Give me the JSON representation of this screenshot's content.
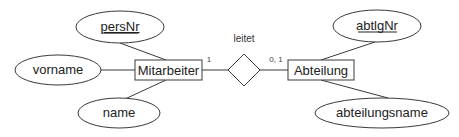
{
  "diagram": {
    "type": "er-diagram",
    "entities": [
      {
        "id": "mitarbeiter",
        "label": "Mitarbeiter"
      },
      {
        "id": "abteilung",
        "label": "Abteilung"
      }
    ],
    "relationship": {
      "label": "leitet",
      "cardinality_left": "1",
      "cardinality_right": "0, 1"
    },
    "attributes": {
      "persNr": {
        "label": "persNr",
        "key": true,
        "entity": "Mitarbeiter"
      },
      "vorname": {
        "label": "vorname",
        "key": false,
        "entity": "Mitarbeiter"
      },
      "name": {
        "label": "name",
        "key": false,
        "entity": "Mitarbeiter"
      },
      "abtlgNr": {
        "label": "abtlgNr",
        "key": true,
        "entity": "Abteilung"
      },
      "abteilungsname": {
        "label": "abteilungsname",
        "key": false,
        "entity": "Abteilung"
      }
    },
    "colors": {
      "stroke": "#3a3a3a",
      "text": "#222222",
      "background": "#ffffff"
    }
  }
}
